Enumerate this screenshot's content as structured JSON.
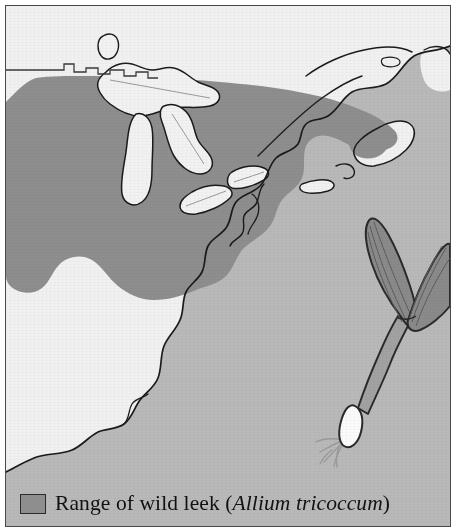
{
  "figure": {
    "kind": "range-map"
  },
  "legend": {
    "swatch_name": "range-swatch",
    "prefix": "Range of wild leek (",
    "species": "Allium tricoccum",
    "suffix": ")",
    "full_text": "Range of wild leek (Allium tricoccum)"
  },
  "colors": {
    "range_fill": "#8e8e8e",
    "land_fill": "#f1f1f1",
    "water_fill": "#b9b9b9",
    "lake_fill": "#f2f2f2",
    "coastline": "#1b1b1b",
    "border_line": "#3a3a3a",
    "frame": "#4a4a4a",
    "plant_leaf": "#8a8a8a",
    "plant_outline": "#2a2a2a",
    "bulb_fill": "#fbfbfb",
    "root": "#9a9a9a",
    "page_background": "#ffffff"
  },
  "map_features": {
    "water_bodies": [
      "Lake Nipigon",
      "Lake Superior",
      "Lake Michigan",
      "Lake Huron",
      "Lake Erie",
      "Lake Ontario",
      "Atlantic Ocean",
      "Gulf of Mexico",
      "Gulf of St. Lawrence",
      "Chesapeake Bay",
      "Long Island Sound"
    ],
    "boundaries": [
      "United States – Canada border (49th parallel)"
    ],
    "landmasses": [
      "eastern United States",
      "southeastern Canada",
      "Nova Scotia",
      "Florida peninsula",
      "Long Island",
      "Cape Cod"
    ]
  },
  "illustration": {
    "name": "wild-leek-plant",
    "parts": [
      "leaf",
      "leaf",
      "stem",
      "bulb",
      "roots"
    ],
    "leaf_count": 2
  }
}
